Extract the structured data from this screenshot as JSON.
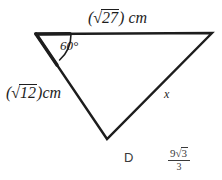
{
  "figure": {
    "type": "triangle-diagram",
    "background_color": "#ffffff",
    "stroke_color": "#1d1d1d",
    "text_color": "#1d1d1d",
    "vertices": {
      "top_left": [
        36,
        34
      ],
      "top_right": [
        212,
        33
      ],
      "bottom": [
        107,
        139
      ]
    },
    "labels": {
      "top_side": {
        "open_paren": "(",
        "radical_sign": "√",
        "radicand": "27",
        "close_paren": ")",
        "unit": "cm",
        "full_text": "(√27) cm"
      },
      "left_side": {
        "open_paren": "(",
        "radical_sign": "√",
        "radicand": "12",
        "close_paren": ")",
        "unit": "cm",
        "full_text": "(√12)cm"
      },
      "angle": {
        "value": "60",
        "degree_symbol": "°",
        "full_text": "60°"
      },
      "unknown_side": {
        "text": "x"
      }
    }
  },
  "answer_choice": {
    "letter": "D",
    "fraction": {
      "numerator_coefficient": "9",
      "numerator_radical_sign": "√",
      "numerator_radicand": "3",
      "denominator": "3",
      "full_text": "9√3/3"
    }
  }
}
